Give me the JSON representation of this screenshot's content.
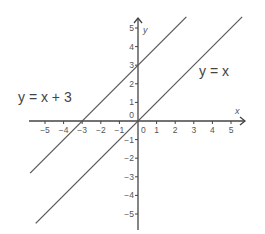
{
  "chart_data": {
    "type": "line",
    "title": "",
    "xlabel": "x",
    "ylabel": "y",
    "xlim": [
      -5.8,
      5.8
    ],
    "ylim": [
      -5.5,
      5.5
    ],
    "x_ticks": [
      -5,
      -4,
      -3,
      -2,
      -1,
      0,
      1,
      2,
      3,
      4,
      5
    ],
    "y_ticks": [
      -5,
      -4,
      -3,
      -2,
      -1,
      0,
      1,
      2,
      3,
      4,
      5
    ],
    "x_tick_labels": [
      "−5",
      "−4",
      "−3",
      "−2",
      "−1",
      "0",
      "1",
      "2",
      "3",
      "4",
      "5"
    ],
    "y_tick_labels": [
      "−5",
      "−4",
      "−3",
      "−2",
      "−1",
      "0",
      "1",
      "2",
      "3",
      "4",
      "5"
    ],
    "grid": false,
    "series": [
      {
        "name": "y = x + 3",
        "slope": 1,
        "intercept": 3,
        "x": [
          -5.8,
          2.6
        ],
        "y": [
          -2.8,
          5.6
        ],
        "color": "#555555"
      },
      {
        "name": "y = x",
        "slope": 1,
        "intercept": 0,
        "x": [
          -5.5,
          5.6
        ],
        "y": [
          -5.5,
          5.6
        ],
        "color": "#555555"
      }
    ],
    "annotations": [
      {
        "text": "y = x + 3",
        "position": "left of y-axis near y=1"
      },
      {
        "text": "y = x",
        "position": "right of y-axis near y=2"
      }
    ]
  },
  "labels": {
    "eq1": "y = x + 3",
    "eq2": "y = x",
    "x_axis": "x",
    "y_axis": "y"
  }
}
